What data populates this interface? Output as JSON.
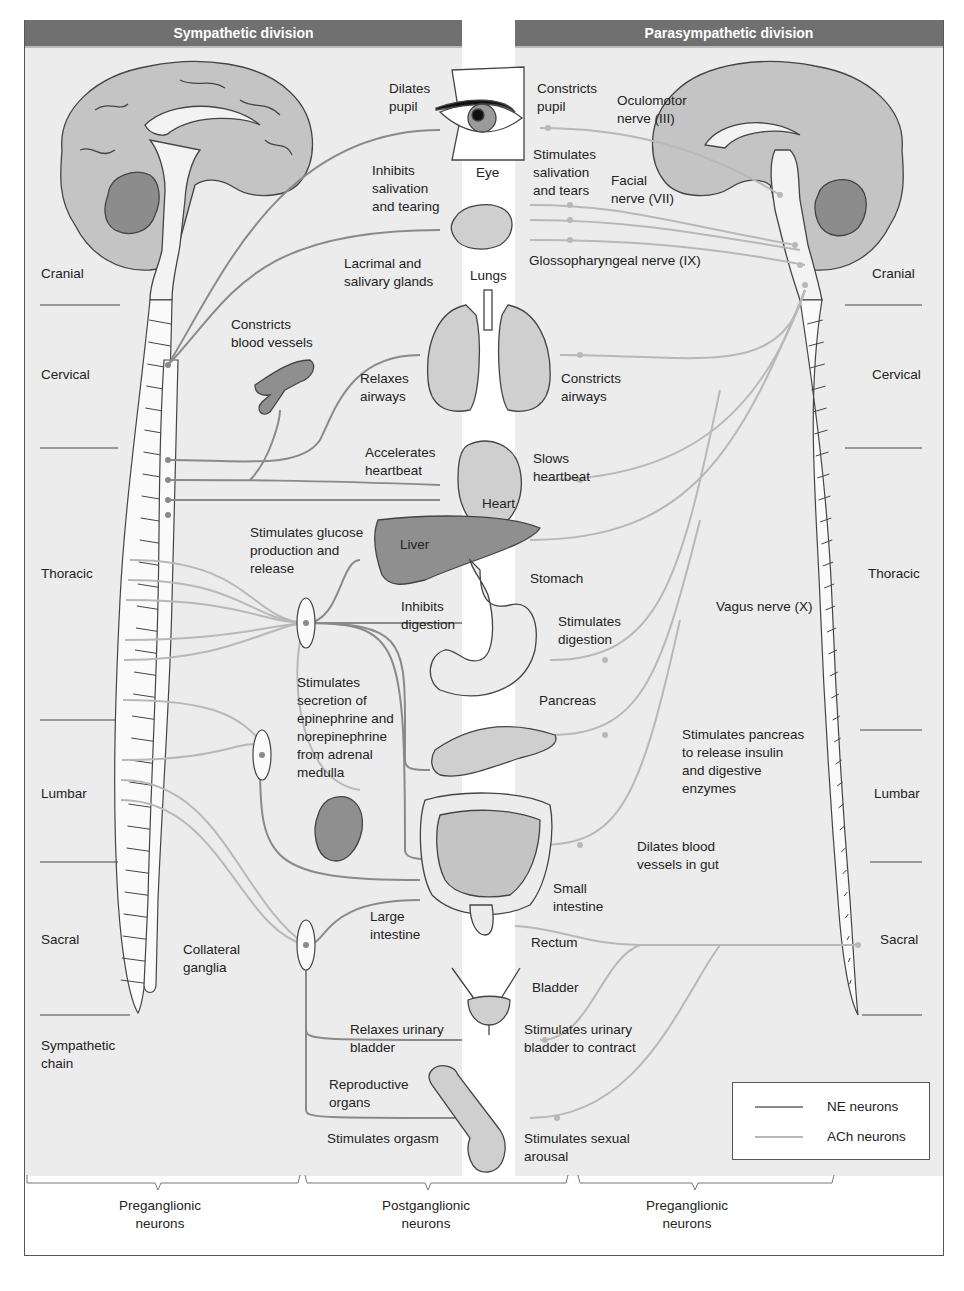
{
  "headers": {
    "sympathetic": "Sympathetic division",
    "parasympathetic": "Parasympathetic division"
  },
  "colors": {
    "header_bg": "#707070",
    "panel_bg": "#ececec",
    "ne_neuron": "#8a8a8a",
    "ach_neuron": "#b8b8b8",
    "brain_cortex": "#c4c4c4",
    "cerebellum": "#8c8c8c",
    "organ_fill": "#cfcfcf",
    "outline": "#444444"
  },
  "spinal_segments": {
    "left": [
      "Cranial",
      "Cervical",
      "Thoracic",
      "Lumbar",
      "Sacral"
    ],
    "right": [
      "Cranial",
      "Cervical",
      "Thoracic",
      "Lumbar",
      "Sacral"
    ]
  },
  "organs": {
    "eye": "Eye",
    "lacrimal_salivary": "Lacrimal and\nsalivary glands",
    "lungs": "Lungs",
    "heart": "Heart",
    "liver": "Liver",
    "stomach": "Stomach",
    "pancreas": "Pancreas",
    "small_intestine": "Small\nintestine",
    "large_intestine": "Large\nintestine",
    "rectum": "Rectum",
    "bladder": "Bladder",
    "reproductive": "Reproductive\norgans"
  },
  "sympathetic_effects": {
    "dilates_pupil": "Dilates\npupil",
    "inhibits_salivation": "Inhibits\nsalivation\nand tearing",
    "constricts_vessels": "Constricts\nblood vessels",
    "relaxes_airways": "Relaxes\nairways",
    "accelerates_heartbeat": "Accelerates\nheartbeat",
    "glucose": "Stimulates glucose\nproduction and\nrelease",
    "inhibits_digestion": "Inhibits\ndigestion",
    "adrenal": "Stimulates\nsecretion of\nepinephrine and\nnorepinephrine\nfrom adrenal\nmedulla",
    "relaxes_bladder": "Relaxes urinary\nbladder",
    "orgasm": "Stimulates orgasm"
  },
  "parasympathetic_effects": {
    "constricts_pupil": "Constricts\npupil",
    "salivation": "Stimulates\nsalivation\nand tears",
    "constricts_airways": "Constricts\nairways",
    "slows_heartbeat": "Slows\nheartbeat",
    "stimulates_digestion": "Stimulates\ndigestion",
    "pancreas_insulin": "Stimulates pancreas\nto release insulin\nand digestive\nenzymes",
    "dilates_gut_vessels": "Dilates blood\nvessels in gut",
    "bladder_contract": "Stimulates urinary\nbladder to contract",
    "sexual_arousal": "Stimulates sexual\narousal"
  },
  "nerves": {
    "oculomotor": "Oculomotor\nnerve (III)",
    "facial": "Facial\nnerve (VII)",
    "glossopharyngeal": "Glossopharyngeal nerve (IX)",
    "vagus": "Vagus nerve (X)"
  },
  "structures": {
    "sympathetic_chain": "Sympathetic\nchain",
    "collateral_ganglia": "Collateral\nganglia"
  },
  "brackets": {
    "left": "Preganglionic\nneurons",
    "middle": "Postganglionic\nneurons",
    "right": "Preganglionic\nneurons"
  },
  "legend": {
    "ne": "NE neurons",
    "ach": "ACh neurons"
  }
}
